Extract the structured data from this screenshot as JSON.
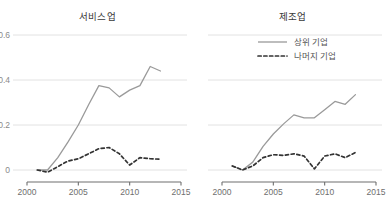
{
  "figure": {
    "background_color": "#ffffff",
    "panel_count": 2
  },
  "chart_data": [
    {
      "type": "line",
      "title": "서비스업",
      "xlabel": "",
      "ylabel": "",
      "xlim": [
        2000,
        2015
      ],
      "ylim": [
        0,
        0.6
      ],
      "xticks": [
        "2000",
        "2005",
        "2010",
        "2015"
      ],
      "yticks": [
        "0",
        "0.2",
        "0.4",
        "0.6"
      ],
      "grid": "horizontal",
      "legend": "none",
      "x": [
        2001,
        2002,
        2003,
        2004,
        2005,
        2006,
        2007,
        2008,
        2009,
        2010,
        2011,
        2012,
        2013
      ],
      "series": [
        {
          "name": "상위 기업",
          "style": "solid",
          "color": "#9a9a9a",
          "values": [
            0.0,
            0.0,
            0.055,
            0.125,
            0.2,
            0.29,
            0.375,
            0.365,
            0.325,
            0.355,
            0.375,
            0.46,
            0.44
          ]
        },
        {
          "name": "나머지 기업",
          "style": "dashed",
          "color": "#333333",
          "values": [
            0.0,
            -0.01,
            0.015,
            0.04,
            0.05,
            0.072,
            0.095,
            0.1,
            0.072,
            0.022,
            0.055,
            0.05,
            0.048
          ]
        }
      ]
    },
    {
      "type": "line",
      "title": "제조업",
      "xlabel": "",
      "ylabel": "",
      "xlim": [
        2000,
        2015
      ],
      "ylim": [
        0,
        0.6
      ],
      "xticks": [
        "2000",
        "2005",
        "2010",
        "2015"
      ],
      "yticks": [
        "0",
        "0.2",
        "0.4",
        "0.6"
      ],
      "grid": "horizontal",
      "legend": "top-right",
      "x": [
        2001,
        2002,
        2003,
        2004,
        2005,
        2006,
        2007,
        2008,
        2009,
        2010,
        2011,
        2012,
        2013
      ],
      "series": [
        {
          "name": "상위 기업",
          "style": "solid",
          "color": "#9a9a9a",
          "values": [
            0.018,
            0.0,
            0.035,
            0.105,
            0.16,
            0.205,
            0.245,
            0.232,
            0.232,
            0.268,
            0.305,
            0.292,
            0.335
          ]
        },
        {
          "name": "나머지 기업",
          "style": "dashed",
          "color": "#333333",
          "values": [
            0.018,
            0.0,
            0.018,
            0.055,
            0.068,
            0.065,
            0.072,
            0.062,
            0.005,
            0.062,
            0.072,
            0.055,
            0.078
          ]
        }
      ]
    }
  ],
  "legend": {
    "entries": [
      {
        "label": "상위 기업",
        "style": "solid",
        "color": "#9a9a9a"
      },
      {
        "label": "나머지 기업",
        "style": "dashed",
        "color": "#333333"
      }
    ]
  },
  "axes": {
    "y_tick_labels": [
      "0.6",
      "0.4",
      "0.2",
      "0"
    ],
    "x_tick_labels_left": [
      "2000",
      "2005",
      "2010",
      "2015"
    ],
    "x_tick_labels_right": [
      "2000",
      "2005",
      "2010",
      "2015"
    ]
  },
  "colors": {
    "solid_line": "#9a9a9a",
    "dashed_line": "#333333",
    "gridline": "#e2e2e2",
    "axis": "#6e6e6e",
    "title_text": "#3a3a3a",
    "tick_text": "#7d7d7d"
  }
}
